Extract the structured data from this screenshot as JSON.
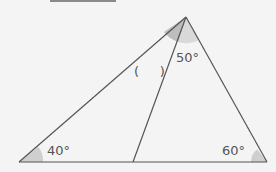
{
  "diagram": {
    "type": "triangle-with-cevian",
    "vertices": {
      "apex": {
        "x": 186,
        "y": 17
      },
      "left": {
        "x": 19,
        "y": 162
      },
      "right": {
        "x": 267,
        "y": 162
      },
      "cevian_foot": {
        "x": 133,
        "y": 162
      }
    },
    "labels": {
      "left_angle": "40°",
      "right_angle": "60°",
      "apex_right_angle": "50°",
      "unknown_angle": "(     )"
    },
    "colors": {
      "line": "#555555",
      "shade": "#c8c8c8",
      "background": "#f4f4f4"
    }
  }
}
